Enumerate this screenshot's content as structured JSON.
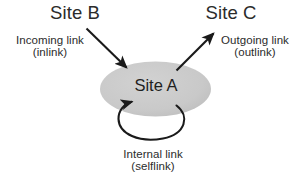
{
  "diagram": {
    "background_color": "#ffffff",
    "node_fill_color": "#c9c9c9",
    "text_color": "#2b2b2b",
    "arrow_color": "#1a1a1a",
    "nodes": [
      {
        "id": "site-b",
        "label": "Site B",
        "shape": "text"
      },
      {
        "id": "site-a",
        "label": "Site A",
        "shape": "ellipse"
      },
      {
        "id": "site-c",
        "label": "Site C",
        "shape": "text"
      }
    ],
    "edges": [
      {
        "id": "inlink",
        "from": "site-b",
        "to": "site-a",
        "label_line1": "Incoming link",
        "label_line2": "(inlink)",
        "direction": "down-right"
      },
      {
        "id": "outlink",
        "from": "site-a",
        "to": "site-c",
        "label_line1": "Outgoing link",
        "label_line2": "(outlink)",
        "direction": "up-right"
      },
      {
        "id": "selflink",
        "from": "site-a",
        "to": "site-a",
        "label_line1": "Internal link",
        "label_line2": "(selflink)",
        "direction": "loop-below"
      }
    ]
  }
}
